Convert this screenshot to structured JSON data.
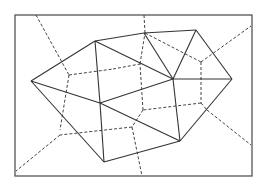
{
  "diagram": {
    "type": "voronoi-delaunay",
    "frame": {
      "x": 15,
      "y": 15,
      "width": 237,
      "height": 161
    },
    "colors": {
      "frame": "#555555",
      "delaunay": "#333333",
      "voronoi": "#444444",
      "background": "#ffffff"
    },
    "delaunay_points": [
      {
        "id": "A",
        "x": 31,
        "y": 81
      },
      {
        "id": "B",
        "x": 95,
        "y": 41
      },
      {
        "id": "C",
        "x": 144,
        "y": 33
      },
      {
        "id": "D",
        "x": 196,
        "y": 30
      },
      {
        "id": "E",
        "x": 232,
        "y": 79
      },
      {
        "id": "F",
        "x": 173,
        "y": 79
      },
      {
        "id": "J",
        "x": 100,
        "y": 103
      },
      {
        "id": "H",
        "x": 180,
        "y": 141
      },
      {
        "id": "I",
        "x": 104,
        "y": 162
      }
    ],
    "delaunay_edges": [
      [
        "A",
        "B"
      ],
      [
        "B",
        "C"
      ],
      [
        "C",
        "D"
      ],
      [
        "D",
        "E"
      ],
      [
        "E",
        "H"
      ],
      [
        "H",
        "I"
      ],
      [
        "I",
        "A"
      ],
      [
        "A",
        "J"
      ],
      [
        "B",
        "J"
      ],
      [
        "B",
        "F"
      ],
      [
        "C",
        "F"
      ],
      [
        "D",
        "F"
      ],
      [
        "F",
        "E"
      ],
      [
        "F",
        "J"
      ],
      [
        "F",
        "H"
      ],
      [
        "J",
        "H"
      ],
      [
        "J",
        "I"
      ]
    ],
    "voronoi_edges": [
      [
        [
          36,
          15
        ],
        [
          69,
          75
        ]
      ],
      [
        [
          69,
          75
        ],
        [
          60,
          130
        ]
      ],
      [
        [
          69,
          75
        ],
        [
          113,
          69
        ]
      ],
      [
        [
          113,
          69
        ],
        [
          140,
          64
        ]
      ],
      [
        [
          140,
          64
        ],
        [
          145,
          33
        ]
      ],
      [
        [
          145,
          33
        ],
        [
          144,
          15
        ]
      ],
      [
        [
          145,
          33
        ],
        [
          201,
          62
        ]
      ],
      [
        [
          201,
          62
        ],
        [
          251,
          26
        ]
      ],
      [
        [
          201,
          62
        ],
        [
          201,
          103
        ]
      ],
      [
        [
          201,
          103
        ],
        [
          207,
          110
        ]
      ],
      [
        [
          207,
          110
        ],
        [
          251,
          145
        ]
      ],
      [
        [
          201,
          103
        ],
        [
          143,
          110
        ]
      ],
      [
        [
          143,
          110
        ],
        [
          140,
          64
        ]
      ],
      [
        [
          143,
          110
        ],
        [
          132,
          127
        ]
      ],
      [
        [
          132,
          127
        ],
        [
          60,
          135
        ]
      ],
      [
        [
          60,
          135
        ],
        [
          16,
          171
        ]
      ],
      [
        [
          132,
          127
        ],
        [
          142,
          176
        ]
      ],
      [
        [
          113,
          69
        ],
        [
          113,
          69
        ]
      ]
    ]
  }
}
